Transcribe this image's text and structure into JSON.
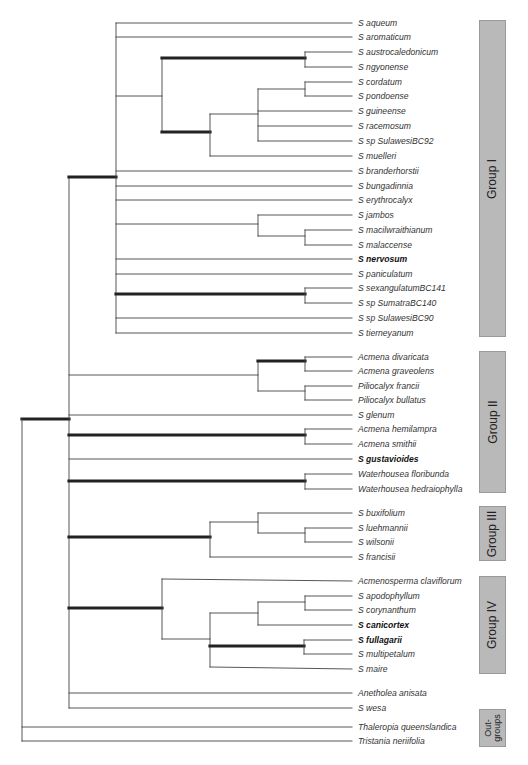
{
  "figure": {
    "type": "phylogenetic-tree",
    "line_color": "#444444",
    "thick_line_color": "#222222",
    "group_box_color": "#b9b9b9"
  },
  "taxa": [
    {
      "id": 0,
      "name": "S aqueum",
      "y": 23,
      "bold": false
    },
    {
      "id": 1,
      "name": "S aromaticum",
      "y": 37,
      "bold": false
    },
    {
      "id": 2,
      "name": "S austrocaledonicum",
      "y": 52,
      "bold": false
    },
    {
      "id": 3,
      "name": "S ngyonense",
      "y": 67,
      "bold": false
    },
    {
      "id": 4,
      "name": "S cordatum",
      "y": 82,
      "bold": false
    },
    {
      "id": 5,
      "name": "S pondoense",
      "y": 96,
      "bold": false
    },
    {
      "id": 6,
      "name": "S guineense",
      "y": 111,
      "bold": false
    },
    {
      "id": 7,
      "name": "S racemosum",
      "y": 126,
      "bold": false
    },
    {
      "id": 8,
      "name": "S sp SulawesiBC92",
      "y": 141,
      "bold": false
    },
    {
      "id": 9,
      "name": "S muelleri",
      "y": 156,
      "bold": false
    },
    {
      "id": 10,
      "name": "S branderhorstii",
      "y": 171,
      "bold": false
    },
    {
      "id": 11,
      "name": "S bungadinnia",
      "y": 186,
      "bold": false
    },
    {
      "id": 12,
      "name": "S erythrocalyx",
      "y": 200,
      "bold": false
    },
    {
      "id": 13,
      "name": "S jambos",
      "y": 215,
      "bold": false
    },
    {
      "id": 14,
      "name": "S macilwraithianum",
      "y": 230,
      "bold": false
    },
    {
      "id": 15,
      "name": "S malaccense",
      "y": 245,
      "bold": false
    },
    {
      "id": 16,
      "name": "S nervosum",
      "y": 259,
      "bold": true
    },
    {
      "id": 17,
      "name": "S paniculatum",
      "y": 274,
      "bold": false
    },
    {
      "id": 18,
      "name": "S sexangulatumBC141",
      "y": 288,
      "bold": false
    },
    {
      "id": 19,
      "name": "S sp SumatraBC140",
      "y": 303,
      "bold": false
    },
    {
      "id": 20,
      "name": "S sp SulawesiBC90",
      "y": 318,
      "bold": false
    },
    {
      "id": 21,
      "name": "S tierneyanum",
      "y": 333,
      "bold": false
    },
    {
      "id": 22,
      "name": "Acmena divaricata",
      "y": 357,
      "bold": false
    },
    {
      "id": 23,
      "name": "Acmena graveolens",
      "y": 371,
      "bold": false
    },
    {
      "id": 24,
      "name": "Piliocalyx francii",
      "y": 386,
      "bold": false
    },
    {
      "id": 25,
      "name": "Piliocalyx bullatus",
      "y": 400,
      "bold": false
    },
    {
      "id": 26,
      "name": "S glenum",
      "y": 415,
      "bold": false
    },
    {
      "id": 27,
      "name": "Acmena hemilampra",
      "y": 429,
      "bold": false
    },
    {
      "id": 28,
      "name": "Acmena smithii",
      "y": 444,
      "bold": false
    },
    {
      "id": 29,
      "name": "S gustavioides",
      "y": 459,
      "bold": true
    },
    {
      "id": 30,
      "name": "Waterhousea floribunda",
      "y": 474,
      "bold": false
    },
    {
      "id": 31,
      "name": "Waterhousea hedraiophylla",
      "y": 489,
      "bold": false
    },
    {
      "id": 32,
      "name": "S buxifolium",
      "y": 513,
      "bold": false
    },
    {
      "id": 33,
      "name": "S luehmannii",
      "y": 528,
      "bold": false
    },
    {
      "id": 34,
      "name": "S wilsonii",
      "y": 542,
      "bold": false
    },
    {
      "id": 35,
      "name": "S francisii",
      "y": 557,
      "bold": false
    },
    {
      "id": 36,
      "name": "Acmenosperma claviflorum",
      "y": 581,
      "bold": false
    },
    {
      "id": 37,
      "name": "S apodophyllum",
      "y": 596,
      "bold": false
    },
    {
      "id": 38,
      "name": "S corynanthum",
      "y": 610,
      "bold": false
    },
    {
      "id": 39,
      "name": "S canicortex",
      "y": 625,
      "bold": true
    },
    {
      "id": 40,
      "name": "S fullagarii",
      "y": 640,
      "bold": true
    },
    {
      "id": 41,
      "name": "S multipetalum",
      "y": 654,
      "bold": false
    },
    {
      "id": 42,
      "name": "S maire",
      "y": 669,
      "bold": false
    },
    {
      "id": 43,
      "name": "Anetholea anisata",
      "y": 693,
      "bold": false
    },
    {
      "id": 44,
      "name": "S wesa",
      "y": 708,
      "bold": false
    },
    {
      "id": 45,
      "name": "Thaleropia queenslandica",
      "y": 727,
      "bold": false
    },
    {
      "id": 46,
      "name": "Tristania neriifolia",
      "y": 741,
      "bold": false
    }
  ],
  "groups": [
    {
      "label": "Group I",
      "top": 20,
      "height": 317,
      "small": false
    },
    {
      "label": "Group II",
      "top": 351,
      "height": 142,
      "small": false
    },
    {
      "label": "Group III",
      "top": 506,
      "height": 55,
      "small": false
    },
    {
      "label": "Group IV",
      "top": 576,
      "height": 98,
      "small": false
    },
    {
      "label": "Out-\ngroups",
      "top": 709,
      "height": 38,
      "small": true
    }
  ],
  "tip_x": 352,
  "segments": [
    {
      "x1": 22,
      "y1": 419,
      "x2": 69,
      "y2": 419,
      "thick": true
    },
    {
      "x1": 22,
      "y1": 419,
      "x2": 22,
      "y2": 741,
      "thick": false
    },
    {
      "x1": 22,
      "y1": 727,
      "x2": 352,
      "y2": 727,
      "thick": false
    },
    {
      "x1": 22,
      "y1": 741,
      "x2": 352,
      "y2": 741,
      "thick": false
    },
    {
      "x1": 69,
      "y1": 177,
      "x2": 69,
      "y2": 708,
      "thick": false
    },
    {
      "x1": 69,
      "y1": 177,
      "x2": 116,
      "y2": 177,
      "thick": true
    },
    {
      "x1": 116,
      "y1": 23,
      "x2": 116,
      "y2": 333,
      "thick": false
    },
    {
      "x1": 116,
      "y1": 23,
      "x2": 352,
      "y2": 23,
      "thick": false
    },
    {
      "x1": 116,
      "y1": 37,
      "x2": 352,
      "y2": 37,
      "thick": false
    },
    {
      "x1": 116,
      "y1": 96,
      "x2": 162,
      "y2": 96,
      "thick": false
    },
    {
      "x1": 162,
      "y1": 58,
      "x2": 162,
      "y2": 132,
      "thick": false
    },
    {
      "x1": 162,
      "y1": 58,
      "x2": 305,
      "y2": 58,
      "thick": true
    },
    {
      "x1": 305,
      "y1": 52,
      "x2": 305,
      "y2": 67,
      "thick": false
    },
    {
      "x1": 305,
      "y1": 52,
      "x2": 352,
      "y2": 52,
      "thick": false
    },
    {
      "x1": 305,
      "y1": 67,
      "x2": 352,
      "y2": 67,
      "thick": false
    },
    {
      "x1": 162,
      "y1": 132,
      "x2": 210,
      "y2": 132,
      "thick": true
    },
    {
      "x1": 210,
      "y1": 114,
      "x2": 210,
      "y2": 156,
      "thick": false
    },
    {
      "x1": 210,
      "y1": 156,
      "x2": 352,
      "y2": 156,
      "thick": false
    },
    {
      "x1": 210,
      "y1": 114,
      "x2": 258,
      "y2": 114,
      "thick": false
    },
    {
      "x1": 258,
      "y1": 89,
      "x2": 258,
      "y2": 141,
      "thick": false
    },
    {
      "x1": 258,
      "y1": 89,
      "x2": 305,
      "y2": 89,
      "thick": false
    },
    {
      "x1": 305,
      "y1": 82,
      "x2": 305,
      "y2": 96,
      "thick": false
    },
    {
      "x1": 305,
      "y1": 82,
      "x2": 352,
      "y2": 82,
      "thick": false
    },
    {
      "x1": 305,
      "y1": 96,
      "x2": 352,
      "y2": 96,
      "thick": false
    },
    {
      "x1": 258,
      "y1": 111,
      "x2": 352,
      "y2": 111,
      "thick": false
    },
    {
      "x1": 258,
      "y1": 126,
      "x2": 352,
      "y2": 126,
      "thick": false
    },
    {
      "x1": 258,
      "y1": 141,
      "x2": 352,
      "y2": 141,
      "thick": false
    },
    {
      "x1": 116,
      "y1": 171,
      "x2": 352,
      "y2": 171,
      "thick": false
    },
    {
      "x1": 116,
      "y1": 186,
      "x2": 352,
      "y2": 186,
      "thick": false
    },
    {
      "x1": 116,
      "y1": 200,
      "x2": 352,
      "y2": 200,
      "thick": false
    },
    {
      "x1": 116,
      "y1": 224,
      "x2": 258,
      "y2": 224,
      "thick": false
    },
    {
      "x1": 258,
      "y1": 215,
      "x2": 258,
      "y2": 236,
      "thick": false
    },
    {
      "x1": 258,
      "y1": 215,
      "x2": 352,
      "y2": 215,
      "thick": false
    },
    {
      "x1": 258,
      "y1": 236,
      "x2": 305,
      "y2": 236,
      "thick": false
    },
    {
      "x1": 305,
      "y1": 230,
      "x2": 305,
      "y2": 245,
      "thick": false
    },
    {
      "x1": 305,
      "y1": 230,
      "x2": 352,
      "y2": 230,
      "thick": false
    },
    {
      "x1": 305,
      "y1": 245,
      "x2": 352,
      "y2": 245,
      "thick": false
    },
    {
      "x1": 116,
      "y1": 259,
      "x2": 352,
      "y2": 259,
      "thick": false
    },
    {
      "x1": 116,
      "y1": 274,
      "x2": 352,
      "y2": 274,
      "thick": false
    },
    {
      "x1": 116,
      "y1": 294,
      "x2": 305,
      "y2": 294,
      "thick": true
    },
    {
      "x1": 305,
      "y1": 288,
      "x2": 305,
      "y2": 303,
      "thick": false
    },
    {
      "x1": 305,
      "y1": 288,
      "x2": 352,
      "y2": 288,
      "thick": false
    },
    {
      "x1": 305,
      "y1": 303,
      "x2": 352,
      "y2": 303,
      "thick": false
    },
    {
      "x1": 116,
      "y1": 318,
      "x2": 352,
      "y2": 318,
      "thick": false
    },
    {
      "x1": 116,
      "y1": 333,
      "x2": 352,
      "y2": 333,
      "thick": false
    },
    {
      "x1": 69,
      "y1": 375,
      "x2": 258,
      "y2": 375,
      "thick": false
    },
    {
      "x1": 258,
      "y1": 361,
      "x2": 258,
      "y2": 391,
      "thick": false
    },
    {
      "x1": 258,
      "y1": 361,
      "x2": 305,
      "y2": 361,
      "thick": true
    },
    {
      "x1": 305,
      "y1": 357,
      "x2": 305,
      "y2": 371,
      "thick": false
    },
    {
      "x1": 305,
      "y1": 357,
      "x2": 352,
      "y2": 357,
      "thick": false
    },
    {
      "x1": 305,
      "y1": 371,
      "x2": 352,
      "y2": 371,
      "thick": false
    },
    {
      "x1": 258,
      "y1": 391,
      "x2": 305,
      "y2": 391,
      "thick": false
    },
    {
      "x1": 305,
      "y1": 386,
      "x2": 305,
      "y2": 400,
      "thick": false
    },
    {
      "x1": 305,
      "y1": 386,
      "x2": 352,
      "y2": 386,
      "thick": false
    },
    {
      "x1": 305,
      "y1": 400,
      "x2": 352,
      "y2": 400,
      "thick": false
    },
    {
      "x1": 69,
      "y1": 415,
      "x2": 352,
      "y2": 415,
      "thick": false
    },
    {
      "x1": 69,
      "y1": 435,
      "x2": 305,
      "y2": 435,
      "thick": true
    },
    {
      "x1": 305,
      "y1": 429,
      "x2": 305,
      "y2": 444,
      "thick": false
    },
    {
      "x1": 305,
      "y1": 429,
      "x2": 352,
      "y2": 429,
      "thick": false
    },
    {
      "x1": 305,
      "y1": 444,
      "x2": 352,
      "y2": 444,
      "thick": false
    },
    {
      "x1": 69,
      "y1": 459,
      "x2": 352,
      "y2": 459,
      "thick": false
    },
    {
      "x1": 69,
      "y1": 481,
      "x2": 305,
      "y2": 481,
      "thick": true
    },
    {
      "x1": 305,
      "y1": 474,
      "x2": 305,
      "y2": 489,
      "thick": false
    },
    {
      "x1": 305,
      "y1": 474,
      "x2": 352,
      "y2": 474,
      "thick": false
    },
    {
      "x1": 305,
      "y1": 489,
      "x2": 352,
      "y2": 489,
      "thick": false
    },
    {
      "x1": 69,
      "y1": 537,
      "x2": 210,
      "y2": 537,
      "thick": true
    },
    {
      "x1": 210,
      "y1": 522,
      "x2": 210,
      "y2": 557,
      "thick": false
    },
    {
      "x1": 210,
      "y1": 522,
      "x2": 258,
      "y2": 522,
      "thick": false
    },
    {
      "x1": 258,
      "y1": 513,
      "x2": 258,
      "y2": 533,
      "thick": false
    },
    {
      "x1": 258,
      "y1": 513,
      "x2": 352,
      "y2": 513,
      "thick": false
    },
    {
      "x1": 258,
      "y1": 533,
      "x2": 305,
      "y2": 533,
      "thick": false
    },
    {
      "x1": 305,
      "y1": 528,
      "x2": 305,
      "y2": 542,
      "thick": false
    },
    {
      "x1": 305,
      "y1": 528,
      "x2": 352,
      "y2": 528,
      "thick": false
    },
    {
      "x1": 305,
      "y1": 542,
      "x2": 352,
      "y2": 542,
      "thick": false
    },
    {
      "x1": 210,
      "y1": 557,
      "x2": 352,
      "y2": 557,
      "thick": false
    },
    {
      "x1": 69,
      "y1": 608,
      "x2": 162,
      "y2": 608,
      "thick": true
    },
    {
      "x1": 162,
      "y1": 579,
      "x2": 162,
      "y2": 639,
      "thick": false
    },
    {
      "x1": 162,
      "y1": 579,
      "x2": 352,
      "y2": 581,
      "thick": false
    },
    {
      "x1": 162,
      "y1": 639,
      "x2": 210,
      "y2": 639,
      "thick": false
    },
    {
      "x1": 210,
      "y1": 613,
      "x2": 210,
      "y2": 667,
      "thick": false
    },
    {
      "x1": 210,
      "y1": 613,
      "x2": 258,
      "y2": 613,
      "thick": false
    },
    {
      "x1": 258,
      "y1": 602,
      "x2": 258,
      "y2": 625,
      "thick": false
    },
    {
      "x1": 258,
      "y1": 602,
      "x2": 305,
      "y2": 602,
      "thick": false
    },
    {
      "x1": 305,
      "y1": 596,
      "x2": 305,
      "y2": 610,
      "thick": false
    },
    {
      "x1": 305,
      "y1": 596,
      "x2": 352,
      "y2": 596,
      "thick": false
    },
    {
      "x1": 305,
      "y1": 610,
      "x2": 352,
      "y2": 610,
      "thick": false
    },
    {
      "x1": 258,
      "y1": 625,
      "x2": 352,
      "y2": 625,
      "thick": false
    },
    {
      "x1": 210,
      "y1": 646,
      "x2": 304,
      "y2": 646,
      "thick": true
    },
    {
      "x1": 304,
      "y1": 640,
      "x2": 304,
      "y2": 654,
      "thick": false
    },
    {
      "x1": 304,
      "y1": 640,
      "x2": 352,
      "y2": 640,
      "thick": false
    },
    {
      "x1": 304,
      "y1": 654,
      "x2": 352,
      "y2": 654,
      "thick": false
    },
    {
      "x1": 210,
      "y1": 667,
      "x2": 352,
      "y2": 669,
      "thick": false
    },
    {
      "x1": 69,
      "y1": 693,
      "x2": 352,
      "y2": 693,
      "thick": false
    },
    {
      "x1": 69,
      "y1": 708,
      "x2": 352,
      "y2": 708,
      "thick": false
    }
  ]
}
